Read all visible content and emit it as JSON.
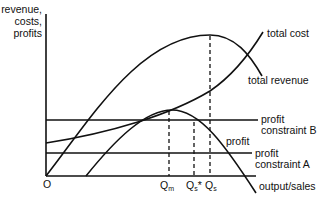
{
  "axes": {
    "y_label_lines": [
      "revenue,",
      "costs,",
      "profits"
    ],
    "x_label": "output/sales",
    "origin_label": "O"
  },
  "curves": {
    "total_cost": "total cost",
    "total_revenue": "total revenue",
    "profit": "profit"
  },
  "constraints": {
    "b_line1": "profit",
    "b_line2": "constraint B",
    "a_line1": "profit",
    "a_line2": "constraint A"
  },
  "ticks": {
    "qm_main": "Q",
    "qm_sub": "m",
    "qs_star_main": "Q",
    "qs_star_sub": "s",
    "qs_star_suffix": "*",
    "qs_main": "Q",
    "qs_sub": "s"
  },
  "colors": {
    "ink": "#111111",
    "background": "#ffffff"
  }
}
